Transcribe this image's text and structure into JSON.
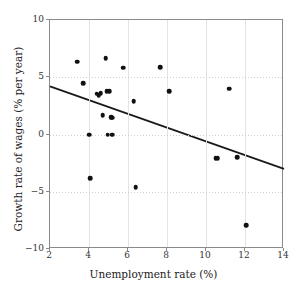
{
  "chart_data": {
    "type": "scatter",
    "title": "",
    "xlabel": "Unemployment rate (%)",
    "ylabel": "Growth rate of wages (% per year)",
    "xlim": [
      2,
      14
    ],
    "ylim": [
      -10,
      10
    ],
    "xticks": [
      2,
      4,
      6,
      8,
      10,
      12,
      14
    ],
    "yticks": [
      10,
      5,
      0,
      -5,
      -10
    ],
    "xtick_labels": [
      "2",
      "4",
      "6",
      "8",
      "10",
      "12",
      "14"
    ],
    "ytick_labels": [
      "10",
      "5",
      "0",
      "−5",
      "−10"
    ],
    "grid": true,
    "legend": null,
    "marker_color": "#111111",
    "trendline_color": "#1a1a1a",
    "points": [
      {
        "x": 3.4,
        "y": 6.35
      },
      {
        "x": 3.7,
        "y": 4.5
      },
      {
        "x": 4.0,
        "y": 0.0
      },
      {
        "x": 4.05,
        "y": -3.8
      },
      {
        "x": 4.4,
        "y": 3.55
      },
      {
        "x": 4.5,
        "y": 3.45
      },
      {
        "x": 4.6,
        "y": 3.6
      },
      {
        "x": 4.7,
        "y": 1.7
      },
      {
        "x": 4.85,
        "y": 6.65
      },
      {
        "x": 4.9,
        "y": 3.8
      },
      {
        "x": 4.95,
        "y": 0.0
      },
      {
        "x": 5.05,
        "y": 3.8
      },
      {
        "x": 5.15,
        "y": 1.5
      },
      {
        "x": 5.2,
        "y": 1.45
      },
      {
        "x": 5.2,
        "y": 0.0
      },
      {
        "x": 5.75,
        "y": 5.85
      },
      {
        "x": 6.3,
        "y": 2.9
      },
      {
        "x": 6.4,
        "y": -4.6
      },
      {
        "x": 7.65,
        "y": 5.9
      },
      {
        "x": 8.1,
        "y": 3.8
      },
      {
        "x": 10.5,
        "y": -2.05
      },
      {
        "x": 10.6,
        "y": -2.05
      },
      {
        "x": 11.2,
        "y": 4.0
      },
      {
        "x": 11.6,
        "y": -2.0
      },
      {
        "x": 12.05,
        "y": -7.9
      }
    ],
    "trendline": {
      "x0": 2,
      "y0": 4.2,
      "x1": 14,
      "y1": -3.0
    }
  }
}
